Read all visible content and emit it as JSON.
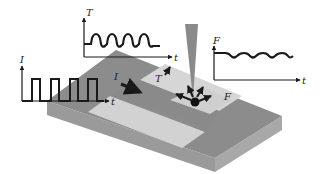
{
  "diagram": {
    "type": "schematic",
    "colors": {
      "background": "#ffffff",
      "block_top": "#8c8c8c",
      "block_front_left": "#9a9a9a",
      "block_front_right": "#a6a6a6",
      "strip_light": "#d4d4d4",
      "strip_dark": "#7c7c7c",
      "tip": "#8a8a8a",
      "ink": "#1a1a1a"
    },
    "plots": {
      "current": {
        "y_label": "I",
        "x_label": "t",
        "waveform": "square"
      },
      "temperature": {
        "y_label": "T",
        "x_label": "t",
        "waveform": "rounded-square"
      },
      "force": {
        "y_label": "F",
        "x_label": "t",
        "waveform": "sinusoidal"
      }
    },
    "annotations": {
      "current_arrow": "I",
      "temperature_arrow": "T",
      "force_label": "F"
    }
  }
}
